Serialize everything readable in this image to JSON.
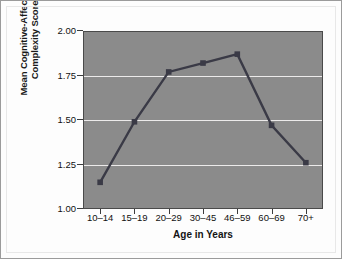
{
  "chart_data": {
    "type": "line",
    "title": "",
    "xlabel": "Age in Years",
    "ylabel_lines": [
      "Mean Cognitive-Affective",
      "Complexity Score"
    ],
    "ylabel": "Mean Cognitive-Affective Complexity Score",
    "categories": [
      "10–14",
      "15–19",
      "20–29",
      "30–45",
      "46–59",
      "60–69",
      "70+"
    ],
    "values": [
      1.15,
      1.49,
      1.77,
      1.82,
      1.87,
      1.47,
      1.26
    ],
    "ylim": [
      1.0,
      2.0
    ],
    "yticks": [
      "1.00",
      "1.25",
      "1.50",
      "1.75",
      "2.00"
    ],
    "ytick_values": [
      1.0,
      1.25,
      1.5,
      1.75,
      2.0
    ],
    "grid": true,
    "gridlines_at": [
      1.25,
      1.5,
      1.75
    ],
    "legend": "none",
    "series": [
      {
        "name": "Mean Cognitive-Affective Complexity Score",
        "values": [
          1.15,
          1.49,
          1.77,
          1.82,
          1.87,
          1.47,
          1.26
        ]
      }
    ],
    "colors": {
      "plot_background": "#8b8b8b",
      "line": "#3a3a46",
      "marker": "#3a3a46",
      "gridline": "#eceaea",
      "axis": "#4a4a4a",
      "page_background": "#fdfdfd",
      "text": "#111111"
    }
  }
}
